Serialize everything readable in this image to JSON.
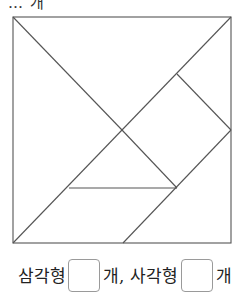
{
  "question": {
    "cut_text": "… 개"
  },
  "diagram": {
    "stroke_color": "#555555",
    "square": {
      "x1": 13,
      "y1": 17,
      "x2": 231,
      "y2": 243
    },
    "lines": [
      {
        "from": [
          13,
          17
        ],
        "to": [
          122,
          130
        ]
      },
      {
        "from": [
          231,
          17
        ],
        "to": [
          122,
          130
        ]
      },
      {
        "from": [
          122,
          130
        ],
        "to": [
          13,
          243
        ]
      },
      {
        "from": [
          122,
          130
        ],
        "to": [
          177,
          188
        ]
      },
      {
        "from": [
          177,
          74
        ],
        "to": [
          231,
          130
        ]
      },
      {
        "from": [
          231,
          130
        ],
        "to": [
          123,
          243
        ]
      },
      {
        "from": [
          69,
          188
        ],
        "to": [
          177,
          188
        ]
      }
    ]
  },
  "answer": {
    "triangle_label": "삼각형",
    "unit1": "개, 사각형",
    "unit2": "개",
    "triangle_count": "",
    "quad_count": ""
  }
}
